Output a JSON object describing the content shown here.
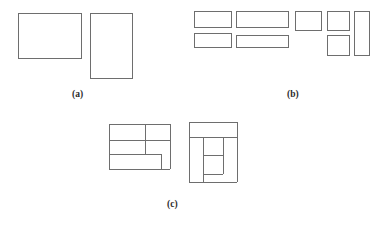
{
  "figure": {
    "background_color": "#ffffff",
    "stroke_color": "#6e6e6e",
    "stroke_width": 1,
    "caption_color": "#2b2b2b",
    "width": 378,
    "height": 227
  },
  "panels": [
    {
      "id": "a",
      "caption": "(a)",
      "caption_x": 72,
      "caption_y": 90,
      "rect_count": 2,
      "rects": [
        {
          "name": "panel-a-rect-1",
          "x": 18,
          "y": 13,
          "w": 64,
          "h": 46
        },
        {
          "name": "panel-a-rect-2",
          "x": 90,
          "y": 13,
          "w": 43,
          "h": 66
        }
      ]
    },
    {
      "id": "b",
      "caption": "(b)",
      "caption_x": 287,
      "caption_y": 90,
      "rect_count": 7,
      "rects": [
        {
          "name": "panel-b-rect-1",
          "x": 194,
          "y": 11,
          "w": 38,
          "h": 17
        },
        {
          "name": "panel-b-rect-2",
          "x": 236,
          "y": 11,
          "w": 53,
          "h": 17
        },
        {
          "name": "panel-b-rect-3",
          "x": 194,
          "y": 33,
          "w": 38,
          "h": 15
        },
        {
          "name": "panel-b-rect-4",
          "x": 236,
          "y": 35,
          "w": 53,
          "h": 13
        },
        {
          "name": "panel-b-rect-5",
          "x": 295,
          "y": 11,
          "w": 27,
          "h": 20
        },
        {
          "name": "panel-b-rect-6",
          "x": 327,
          "y": 11,
          "w": 23,
          "h": 20
        },
        {
          "name": "panel-b-rect-7",
          "x": 327,
          "y": 35,
          "w": 23,
          "h": 21
        },
        {
          "name": "panel-b-rect-8",
          "x": 354,
          "y": 11,
          "w": 16,
          "h": 45
        }
      ]
    },
    {
      "id": "c",
      "caption": "(c)",
      "caption_x": 167,
      "caption_y": 200,
      "rect_count": 2,
      "figures": [
        {
          "name": "panel-c-figure-left",
          "x": 109,
          "y": 124,
          "w": 61,
          "h": 45,
          "segments": [
            {
              "name": "c-left-outer-top",
              "x1": 0,
              "y1": 0,
              "x2": 61,
              "y2": 0
            },
            {
              "name": "c-left-outer-left",
              "x1": 0,
              "y1": 0,
              "x2": 0,
              "y2": 45
            },
            {
              "name": "c-left-outer-bottom",
              "x1": 0,
              "y1": 45,
              "x2": 61,
              "y2": 45
            },
            {
              "name": "c-left-outer-right",
              "x1": 61,
              "y1": 0,
              "x2": 61,
              "y2": 45
            },
            {
              "name": "c-left-divider-h1",
              "x1": 0,
              "y1": 16,
              "x2": 36,
              "y2": 16
            },
            {
              "name": "c-left-divider-v1",
              "x1": 36,
              "y1": 0,
              "x2": 36,
              "y2": 30
            },
            {
              "name": "c-left-divider-h2",
              "x1": 36,
              "y1": 16,
              "x2": 61,
              "y2": 16
            },
            {
              "name": "c-left-divider-h3",
              "x1": 0,
              "y1": 30,
              "x2": 52,
              "y2": 30
            },
            {
              "name": "c-left-divider-v2",
              "x1": 52,
              "y1": 30,
              "x2": 52,
              "y2": 45
            }
          ]
        },
        {
          "name": "panel-c-figure-right",
          "x": 189,
          "y": 122,
          "w": 48,
          "h": 60,
          "segments": [
            {
              "name": "c-right-outer-top",
              "x1": 0,
              "y1": 0,
              "x2": 48,
              "y2": 0
            },
            {
              "name": "c-right-outer-left",
              "x1": 0,
              "y1": 0,
              "x2": 0,
              "y2": 60
            },
            {
              "name": "c-right-outer-bottom",
              "x1": 0,
              "y1": 60,
              "x2": 48,
              "y2": 60
            },
            {
              "name": "c-right-outer-right",
              "x1": 48,
              "y1": 0,
              "x2": 48,
              "y2": 60
            },
            {
              "name": "c-right-divider-h1",
              "x1": 0,
              "y1": 15,
              "x2": 48,
              "y2": 15
            },
            {
              "name": "c-right-divider-v1",
              "x1": 14,
              "y1": 15,
              "x2": 14,
              "y2": 60
            },
            {
              "name": "c-right-divider-v2",
              "x1": 34,
              "y1": 15,
              "x2": 34,
              "y2": 52
            },
            {
              "name": "c-right-divider-h2",
              "x1": 14,
              "y1": 33,
              "x2": 34,
              "y2": 33
            },
            {
              "name": "c-right-divider-h3",
              "x1": 14,
              "y1": 52,
              "x2": 34,
              "y2": 52
            }
          ]
        }
      ]
    }
  ]
}
